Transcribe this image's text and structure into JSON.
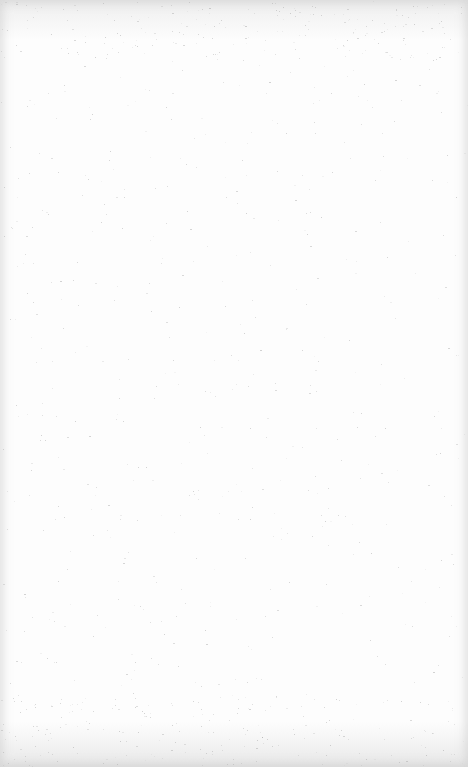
{
  "page": {
    "background_color": "#fdfdfd",
    "edge_shade_color": "#d8d8d8",
    "speckle_color": "#9a9a9a",
    "content": []
  }
}
